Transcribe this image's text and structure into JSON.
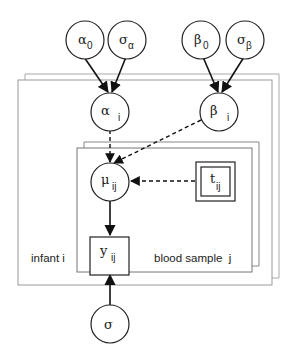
{
  "diagram": {
    "type": "bayesian-plate-diagram",
    "nodes": [
      {
        "id": "alpha0",
        "symbol": "α",
        "subscript": "0",
        "shape": "circle"
      },
      {
        "id": "sigma_alpha",
        "symbol": "σ",
        "subscript": "α",
        "shape": "circle"
      },
      {
        "id": "beta0",
        "symbol": "β",
        "subscript": "0",
        "shape": "circle"
      },
      {
        "id": "sigma_beta",
        "symbol": "σ",
        "subscript": "β",
        "shape": "circle"
      },
      {
        "id": "alpha_i",
        "symbol": "α",
        "subscript": "i",
        "shape": "circle"
      },
      {
        "id": "beta_i",
        "symbol": "β",
        "subscript": "i",
        "shape": "circle"
      },
      {
        "id": "mu_ij",
        "symbol": "μ",
        "subscript": "ij",
        "shape": "circle"
      },
      {
        "id": "t_ij",
        "symbol": "t",
        "subscript": "ij",
        "shape": "double-square"
      },
      {
        "id": "y_ij",
        "symbol": "y",
        "subscript": "ij",
        "shape": "square"
      },
      {
        "id": "sigma",
        "symbol": "σ",
        "subscript": "",
        "shape": "circle"
      }
    ],
    "edges": [
      {
        "from": "alpha0",
        "to": "alpha_i",
        "style": "solid"
      },
      {
        "from": "sigma_alpha",
        "to": "alpha_i",
        "style": "solid"
      },
      {
        "from": "beta0",
        "to": "beta_i",
        "style": "solid"
      },
      {
        "from": "sigma_beta",
        "to": "beta_i",
        "style": "solid"
      },
      {
        "from": "alpha_i",
        "to": "mu_ij",
        "style": "dashed"
      },
      {
        "from": "beta_i",
        "to": "mu_ij",
        "style": "dashed"
      },
      {
        "from": "t_ij",
        "to": "mu_ij",
        "style": "dashed"
      },
      {
        "from": "mu_ij",
        "to": "y_ij",
        "style": "solid"
      },
      {
        "from": "sigma",
        "to": "y_ij",
        "style": "solid"
      }
    ],
    "plates": [
      {
        "id": "infant",
        "label": "infant i"
      },
      {
        "id": "blood_sample",
        "label": "blood sample  j"
      }
    ]
  }
}
